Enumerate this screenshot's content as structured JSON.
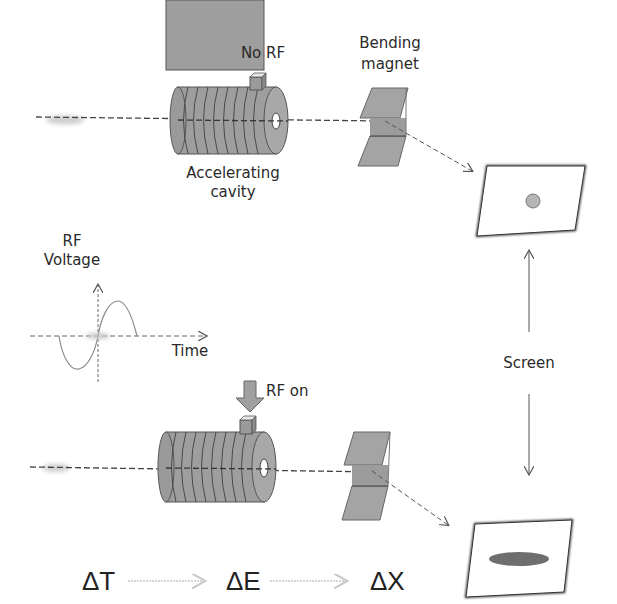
{
  "diagram": {
    "top_setup": {
      "rf_label": "No RF",
      "cavity_label_line1": "Accelerating",
      "cavity_label_line2": "cavity",
      "magnet_label_line1": "Bending",
      "magnet_label_line2": "magnet",
      "screen_spot": "round spot"
    },
    "rf_plot": {
      "ylabel_line1": "RF",
      "ylabel_line2": "Voltage",
      "xlabel": "Time",
      "curve": "sine wave"
    },
    "bottom_setup": {
      "rf_label": "RF on",
      "screen_spot": "elongated horizontal spot"
    },
    "screen_label": "Screen",
    "relations": {
      "items": [
        "ΔT",
        "ΔE",
        "ΔX"
      ]
    },
    "colors": {
      "component_fill": "#9a9a9a",
      "component_dark": "#7a7a7a",
      "beam_line": "#444444",
      "bunch": "#c8c8c8",
      "spot_round": "#b5b5b5",
      "spot_elongated": "#6e6e6e",
      "text": "#2a2a2a",
      "arrow_faint": "#c9c9c9"
    }
  }
}
